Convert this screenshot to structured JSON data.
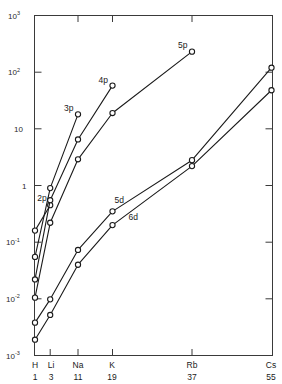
{
  "chart_data": {
    "type": "line",
    "title": "",
    "xlabel": "",
    "ylabel": "",
    "scale": "semilogy",
    "grid": false,
    "legend": "inline-labels",
    "ylim": [
      0.001,
      1000
    ],
    "y_tick_labels": [
      "10",
      "10",
      "10",
      "1",
      "10",
      "10",
      "10"
    ],
    "y_ticks": [
      {
        "label_base": "10",
        "label_exp": "3",
        "value": 1000
      },
      {
        "label_base": "10",
        "label_exp": "2",
        "value": 100
      },
      {
        "label_base": "10",
        "label_exp": "",
        "value": 10
      },
      {
        "label_base": "1",
        "label_exp": "",
        "value": 1
      },
      {
        "label_base": "10",
        "label_exp": "-1",
        "value": 0.1
      },
      {
        "label_base": "10",
        "label_exp": "-2",
        "value": 0.01
      },
      {
        "label_base": "10",
        "label_exp": "-3",
        "value": 0.001
      }
    ],
    "x_ticks": [
      {
        "symbol": "H",
        "z": "1"
      },
      {
        "symbol": "Li",
        "z": "3"
      },
      {
        "symbol": "Na",
        "z": "11"
      },
      {
        "symbol": "K",
        "z": "19"
      },
      {
        "symbol": "Rb",
        "z": "37"
      },
      {
        "symbol": "Cs",
        "z": "55"
      }
    ],
    "categories": [
      "H",
      "Li",
      "Na",
      "K",
      "Rb",
      "Cs"
    ],
    "series": [
      {
        "name": "2p",
        "label": "2p",
        "x": [
          "H",
          "Li"
        ],
        "values": [
          0.16,
          0.45
        ]
      },
      {
        "name": "3p",
        "label": "3p",
        "x": [
          "H",
          "Li",
          "Na"
        ],
        "values": [
          0.055,
          0.9,
          18
        ]
      },
      {
        "name": "4p",
        "label": "4p",
        "x": [
          "H",
          "Li",
          "Na",
          "K"
        ],
        "values": [
          0.022,
          0.55,
          6.5,
          58
        ]
      },
      {
        "name": "5p",
        "label": "5p",
        "x": [
          "H",
          "Li",
          "Na",
          "K",
          "Rb"
        ],
        "values": [
          0.0105,
          0.22,
          2.9,
          19,
          230
        ]
      },
      {
        "name": "5d",
        "label": "5d",
        "x": [
          "H",
          "Li",
          "Na",
          "K",
          "Rb",
          "Cs"
        ],
        "values": [
          0.0038,
          0.0098,
          0.073,
          0.35,
          2.8,
          120
        ]
      },
      {
        "name": "6d",
        "label": "6d",
        "x": [
          "H",
          "Li",
          "Na",
          "K",
          "Rb",
          "Cs"
        ],
        "values": [
          0.0019,
          0.0052,
          0.04,
          0.2,
          2.2,
          48
        ]
      }
    ],
    "annotations": [
      {
        "text": "2p",
        "near": "2p-endpoint"
      },
      {
        "text": "3p",
        "near": "3p-endpoint"
      },
      {
        "text": "4p",
        "near": "4p-endpoint"
      },
      {
        "text": "5p",
        "near": "5p-endpoint"
      },
      {
        "text": "5d",
        "near": "5d-midcurve"
      },
      {
        "text": "6d",
        "near": "6d-midcurve"
      }
    ]
  }
}
